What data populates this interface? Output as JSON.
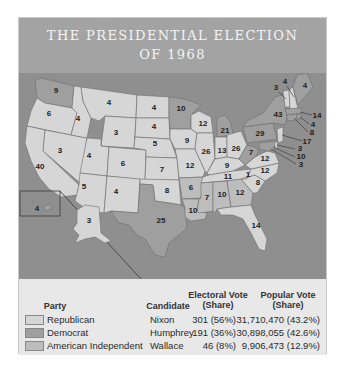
{
  "title": {
    "line1": "THE PRESIDENTIAL ELECTION",
    "line2": "OF 1968"
  },
  "colors": {
    "republican": "#d6d6d6",
    "democrat": "#9f9f9f",
    "american_independent": "#bdbdbd",
    "water": "#8f8f8f",
    "header": "#a3a3a3"
  },
  "map": {
    "states": [
      {
        "abbr": "WA",
        "ev": "9",
        "party": "democrat"
      },
      {
        "abbr": "OR",
        "ev": "6",
        "party": "republican"
      },
      {
        "abbr": "CA",
        "ev": "40",
        "party": "republican"
      },
      {
        "abbr": "ID",
        "ev": "4",
        "party": "republican"
      },
      {
        "abbr": "NV",
        "ev": "3",
        "party": "republican"
      },
      {
        "abbr": "MT",
        "ev": "4",
        "party": "republican"
      },
      {
        "abbr": "WY",
        "ev": "3",
        "party": "republican"
      },
      {
        "abbr": "UT",
        "ev": "4",
        "party": "republican"
      },
      {
        "abbr": "AZ",
        "ev": "5",
        "party": "republican"
      },
      {
        "abbr": "CO",
        "ev": "6",
        "party": "republican"
      },
      {
        "abbr": "NM",
        "ev": "4",
        "party": "republican"
      },
      {
        "abbr": "ND",
        "ev": "4",
        "party": "republican"
      },
      {
        "abbr": "SD",
        "ev": "4",
        "party": "republican"
      },
      {
        "abbr": "NE",
        "ev": "5",
        "party": "republican"
      },
      {
        "abbr": "KS",
        "ev": "7",
        "party": "republican"
      },
      {
        "abbr": "OK",
        "ev": "8",
        "party": "republican"
      },
      {
        "abbr": "TX",
        "ev": "25",
        "party": "democrat"
      },
      {
        "abbr": "MN",
        "ev": "10",
        "party": "democrat"
      },
      {
        "abbr": "IA",
        "ev": "9",
        "party": "republican"
      },
      {
        "abbr": "MO",
        "ev": "12",
        "party": "republican"
      },
      {
        "abbr": "AR",
        "ev": "6",
        "party": "american_independent"
      },
      {
        "abbr": "LA",
        "ev": "10",
        "party": "american_independent"
      },
      {
        "abbr": "WI",
        "ev": "12",
        "party": "republican"
      },
      {
        "abbr": "IL",
        "ev": "26",
        "party": "republican"
      },
      {
        "abbr": "MI",
        "ev": "21",
        "party": "democrat"
      },
      {
        "abbr": "IN",
        "ev": "13",
        "party": "republican"
      },
      {
        "abbr": "OH",
        "ev": "26",
        "party": "republican"
      },
      {
        "abbr": "KY",
        "ev": "9",
        "party": "republican"
      },
      {
        "abbr": "TN",
        "ev": "11",
        "party": "republican"
      },
      {
        "abbr": "MS",
        "ev": "7",
        "party": "american_independent"
      },
      {
        "abbr": "AL",
        "ev": "10",
        "party": "american_independent"
      },
      {
        "abbr": "GA",
        "ev": "12",
        "party": "american_independent"
      },
      {
        "abbr": "FL",
        "ev": "14",
        "party": "republican"
      },
      {
        "abbr": "SC",
        "ev": "8",
        "party": "republican"
      },
      {
        "abbr": "NC",
        "ev": "12",
        "party": "republican"
      },
      {
        "abbr": "NC-faithless",
        "ev": "1",
        "party": "american_independent"
      },
      {
        "abbr": "VA",
        "ev": "12",
        "party": "republican"
      },
      {
        "abbr": "WV",
        "ev": "7",
        "party": "democrat"
      },
      {
        "abbr": "PA",
        "ev": "29",
        "party": "democrat"
      },
      {
        "abbr": "NY",
        "ev": "43",
        "party": "democrat"
      },
      {
        "abbr": "VT",
        "ev": "3",
        "party": "republican"
      },
      {
        "abbr": "NH",
        "ev": "4",
        "party": "republican"
      },
      {
        "abbr": "ME",
        "ev": "4",
        "party": "democrat"
      },
      {
        "abbr": "MA",
        "ev": "14",
        "party": "democrat"
      },
      {
        "abbr": "RI",
        "ev": "4",
        "party": "democrat"
      },
      {
        "abbr": "CT",
        "ev": "8",
        "party": "democrat"
      },
      {
        "abbr": "NJ",
        "ev": "17",
        "party": "republican"
      },
      {
        "abbr": "DE",
        "ev": "3",
        "party": "republican"
      },
      {
        "abbr": "MD",
        "ev": "10",
        "party": "democrat"
      },
      {
        "abbr": "DC",
        "ev": "3",
        "party": "democrat"
      },
      {
        "abbr": "AK",
        "ev": "3",
        "party": "republican"
      },
      {
        "abbr": "HI",
        "ev": "4",
        "party": "democrat"
      }
    ]
  },
  "legend": {
    "headers": {
      "party": "Party",
      "candidate": "Candidate",
      "electoral_line1": "Electoral Vote",
      "electoral_line2": "(Share)",
      "popular_line1": "Popular Vote",
      "popular_line2": "(Share)"
    },
    "rows": [
      {
        "party": "Republican",
        "candidate": "Nixon",
        "electoral": "301 (56%)",
        "popular": "31,710,470 (43.2%)",
        "color": "#d6d6d6"
      },
      {
        "party": "Democrat",
        "candidate": "Humphrey",
        "electoral": "191 (36%)",
        "popular": "30,898,055 (42.6%)",
        "color": "#9f9f9f"
      },
      {
        "party": "American Independent",
        "candidate": "Wallace",
        "electoral": "46 (8%)",
        "popular": "9,906,473 (12.9%)",
        "color": "#bdbdbd"
      }
    ]
  }
}
